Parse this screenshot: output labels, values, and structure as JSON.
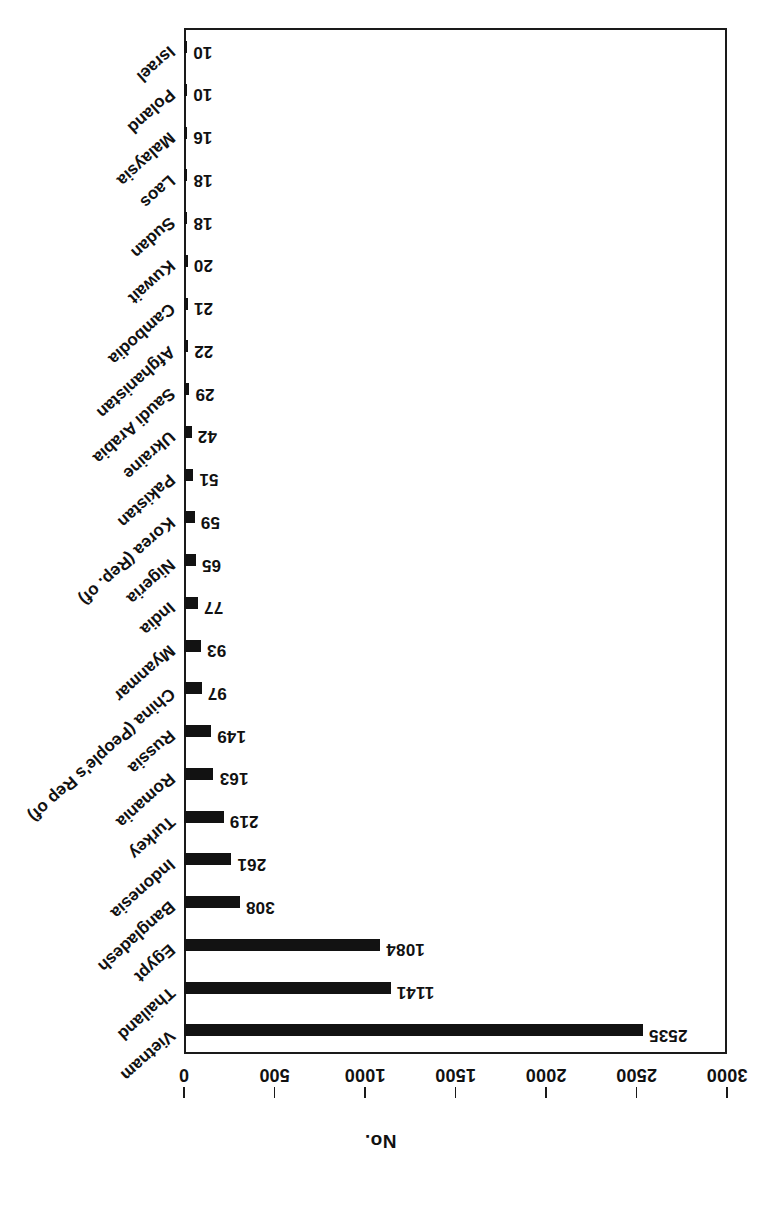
{
  "chart_data": {
    "type": "bar",
    "orientation": "horizontal",
    "title": "",
    "xlabel": "",
    "ylabel": "No.",
    "axis_title": "No.",
    "value_axis_label": "No.",
    "ylim": [
      0,
      3000
    ],
    "value_ticks": [
      0,
      500,
      1000,
      1500,
      2000,
      2500,
      3000
    ],
    "tick_labels": [
      "0",
      "500",
      "1000",
      "1500",
      "2000",
      "2500",
      "3000"
    ],
    "grid": false,
    "legend": null,
    "bar_color": "#121212",
    "frame_color": "#1a1a1a",
    "categories": [
      "Vietnam",
      "Thailand",
      "Egypt",
      "Bangladesh",
      "Indonesia",
      "Turkey",
      "Romania",
      "Russia",
      "China (People's Rep of)",
      "Myanmar",
      "India",
      "Nigeria",
      "Korea (Rep. of)",
      "Pakistan",
      "Ukraine",
      "Saudi Arabia",
      "Afghanistan",
      "Cambodia",
      "Kuwait",
      "Sudan",
      "Laos",
      "Malaysia",
      "Poland",
      "Israel"
    ],
    "values": [
      2535,
      1141,
      1084,
      308,
      261,
      219,
      163,
      149,
      97,
      93,
      77,
      65,
      59,
      51,
      42,
      29,
      22,
      21,
      20,
      18,
      18,
      16,
      10,
      10
    ],
    "value_labels": [
      "2535",
      "1141",
      "1084",
      "308",
      "261",
      "219",
      "163",
      "149",
      "97",
      "93",
      "77",
      "65",
      "59",
      "51",
      "42",
      "29",
      "22",
      "21",
      "20",
      "18",
      "18",
      "16",
      "10",
      "10"
    ]
  }
}
